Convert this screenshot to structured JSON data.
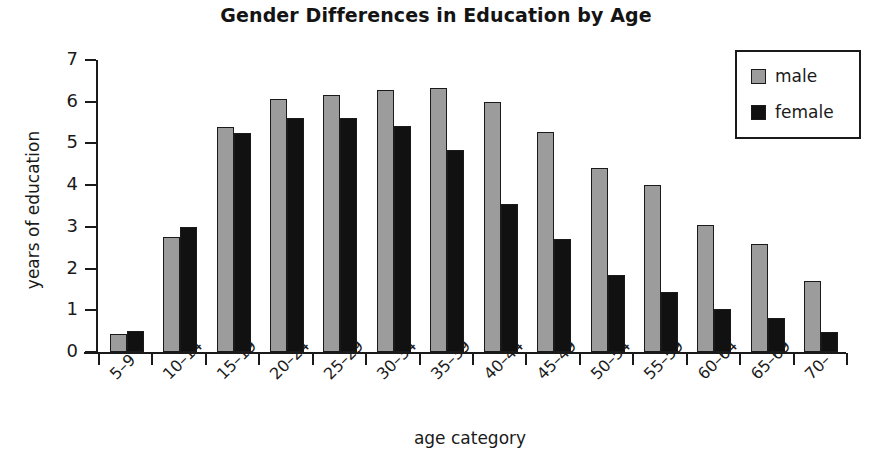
{
  "chart_data": {
    "type": "bar",
    "title": "Gender Differences in Education by Age",
    "xlabel": "age category",
    "ylabel": "years of education",
    "ylim": [
      0,
      7
    ],
    "yticks": [
      0,
      1,
      2,
      3,
      4,
      5,
      6,
      7
    ],
    "grid": false,
    "legend_position": "top-right",
    "categories": [
      "5–9",
      "10–14",
      "15–19",
      "20–24",
      "25–29",
      "30–34",
      "35–39",
      "40–44",
      "45–49",
      "50–54",
      "55–59",
      "60–64",
      "65–69",
      "70–"
    ],
    "series": [
      {
        "name": "male",
        "color": "#9c9c9c",
        "values": [
          0.42,
          2.75,
          5.4,
          6.07,
          6.17,
          6.27,
          6.33,
          6.0,
          5.27,
          4.42,
          4.0,
          3.05,
          2.6,
          1.7
        ]
      },
      {
        "name": "female",
        "color": "#111111",
        "values": [
          0.5,
          3.0,
          5.25,
          5.6,
          5.6,
          5.42,
          4.85,
          3.55,
          2.72,
          1.85,
          1.45,
          1.02,
          0.82,
          0.47
        ]
      }
    ]
  }
}
